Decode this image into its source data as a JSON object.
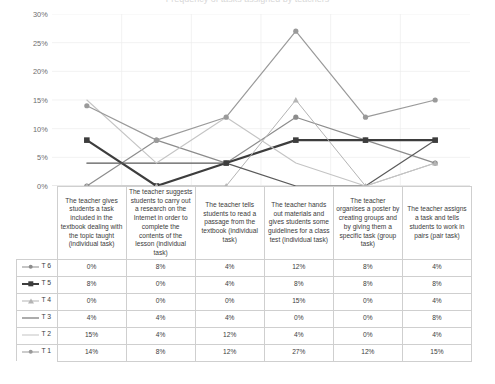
{
  "title": "Frequency of tasks assigned by teachers",
  "chart_data": {
    "type": "line",
    "title": "Frequency of tasks assigned by teachers",
    "xlabel": "",
    "ylabel": "",
    "ylim": [
      0,
      30
    ],
    "yticks": [
      "0%",
      "5%",
      "10%",
      "15%",
      "20%",
      "25%",
      "30%"
    ],
    "ytick_values": [
      0,
      5,
      10,
      15,
      20,
      25,
      30
    ],
    "grid": true,
    "legend_position": "table-left",
    "categories": [
      "The teacher gives students a task included in the textbook dealing with the topic taught (individual task)",
      "The teacher suggests students to carry out a research on the Internet in order to complete the contents of the lesson (individual task)",
      "The teacher tells students to read a passage from the textbook (individual task)",
      "The teacher hands out materials and gives students some guidelines for a class test (individual task)",
      "The teacher organises a poster by creating groups and by giving them a specific task (group task)",
      "The teacher assigns a task and tells students to work in pairs (pair task)"
    ],
    "series": [
      {
        "name": "T 6",
        "values": [
          0,
          8,
          4,
          12,
          8,
          4
        ],
        "labels": [
          "0%",
          "8%",
          "4%",
          "12%",
          "8%",
          "4%"
        ],
        "color": "#8c8c8c",
        "marker": "circle",
        "width": 1.2
      },
      {
        "name": "T 5",
        "values": [
          8,
          0,
          4,
          8,
          8,
          8
        ],
        "labels": [
          "8%",
          "0%",
          "4%",
          "8%",
          "8%",
          "8%"
        ],
        "color": "#3d3d3d",
        "marker": "square",
        "width": 2.2
      },
      {
        "name": "T 4",
        "values": [
          0,
          0,
          0,
          15,
          0,
          4
        ],
        "labels": [
          "0%",
          "0%",
          "0%",
          "15%",
          "0%",
          "4%"
        ],
        "color": "#b4b4b4",
        "marker": "triangle",
        "width": 1.0
      },
      {
        "name": "T 3",
        "values": [
          4,
          4,
          4,
          0,
          0,
          8
        ],
        "labels": [
          "4%",
          "4%",
          "4%",
          "0%",
          "0%",
          "8%"
        ],
        "color": "#5a5a5a",
        "marker": "none",
        "width": 1.2
      },
      {
        "name": "T 2",
        "values": [
          15,
          4,
          12,
          4,
          0,
          4
        ],
        "labels": [
          "15%",
          "4%",
          "12%",
          "4%",
          "0%",
          "4%"
        ],
        "color": "#c4c4c4",
        "marker": "none",
        "width": 1.1
      },
      {
        "name": "T 1",
        "values": [
          14,
          8,
          12,
          27,
          12,
          15
        ],
        "labels": [
          "14%",
          "8%",
          "12%",
          "27%",
          "12%",
          "15%"
        ],
        "color": "#9a9a9a",
        "marker": "circle",
        "width": 1.2
      }
    ]
  },
  "table": {
    "legend_labels": [
      "T 6",
      "T 5",
      "T 4",
      "T 3",
      "T 2",
      "T 1"
    ],
    "rows": [
      [
        "0%",
        "8%",
        "4%",
        "12%",
        "8%",
        "4%"
      ],
      [
        "8%",
        "0%",
        "4%",
        "8%",
        "8%",
        "8%"
      ],
      [
        "0%",
        "0%",
        "0%",
        "15%",
        "0%",
        "4%"
      ],
      [
        "4%",
        "4%",
        "4%",
        "0%",
        "0%",
        "8%"
      ],
      [
        "15%",
        "4%",
        "12%",
        "4%",
        "0%",
        "4%"
      ],
      [
        "14%",
        "8%",
        "12%",
        "27%",
        "12%",
        "15%"
      ]
    ]
  }
}
